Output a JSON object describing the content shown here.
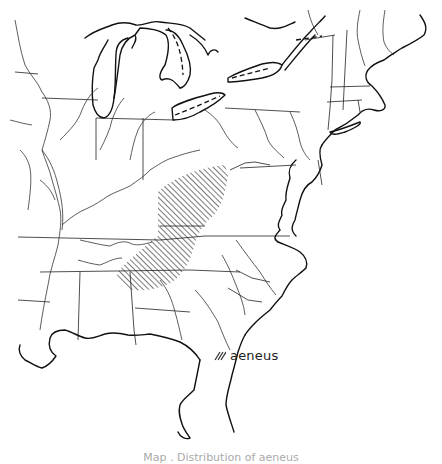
{
  "map": {
    "title": "Distribution map",
    "region": "Eastern United States",
    "background_color": "#ffffff",
    "line_color": "#111111",
    "range": {
      "species": "aeneus",
      "pattern": "diagonal-hatch",
      "areas": [
        "Ohio River valley / Appalachian plateau",
        "Tennessee–Kentucky–northern Alabama"
      ]
    }
  },
  "legend": {
    "items": [
      {
        "symbol": "hatch-icon",
        "label": "aeneus"
      }
    ]
  },
  "caption": {
    "text": "Map . Distribution of aeneus"
  }
}
